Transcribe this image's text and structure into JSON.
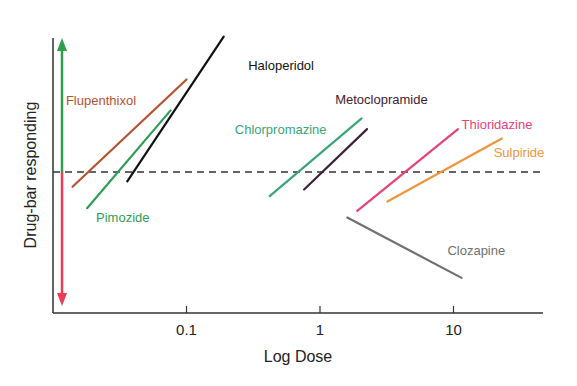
{
  "chart_data": {
    "type": "line",
    "title": "",
    "xlabel": "Log Dose",
    "ylabel": "Drug-bar responding",
    "xscale": "log",
    "xlim": [
      0.0105,
      44
    ],
    "ylim": [
      -1.05,
      1.0
    ],
    "x_ticks": [
      {
        "value": 0.1,
        "label": "0.1"
      },
      {
        "value": 1,
        "label": "1"
      },
      {
        "value": 10,
        "label": "10"
      }
    ],
    "baseline": {
      "value": 0,
      "style": "dashed",
      "color": "#333333"
    },
    "direction_arrow": {
      "up_color": "#2e9e4f",
      "down_color": "#ee3b55",
      "at_dose": 0.012
    },
    "grid": false,
    "legend": "inline-labels",
    "series": [
      {
        "name": "Flupenthixol",
        "color": "#b5522f",
        "x": [
          0.014,
          0.1
        ],
        "y": [
          -0.11,
          0.69
        ],
        "label_at": {
          "x": 0.0125,
          "y": 0.5
        }
      },
      {
        "name": "Pimozide",
        "color": "#2f9e57",
        "x": [
          0.018,
          0.076
        ],
        "y": [
          -0.27,
          0.46
        ],
        "label_at": {
          "x": 0.021,
          "y": -0.37
        }
      },
      {
        "name": "Haloperidol",
        "color": "#111111",
        "x": [
          0.036,
          0.19
        ],
        "y": [
          -0.07,
          1.01
        ],
        "label_at": {
          "x": 0.29,
          "y": 0.76
        }
      },
      {
        "name": "Chlorpromazine",
        "color": "#3aa57a",
        "x": [
          0.42,
          2.05
        ],
        "y": [
          -0.18,
          0.4
        ],
        "label_at": {
          "x": 0.23,
          "y": 0.28
        }
      },
      {
        "name": "Metoclopramide",
        "color": "#3d2136",
        "x": [
          0.76,
          2.25
        ],
        "y": [
          -0.13,
          0.32
        ],
        "label_at": {
          "x": 1.3,
          "y": 0.51
        }
      },
      {
        "name": "Thioridazine",
        "color": "#e8427a",
        "x": [
          1.9,
          10.8
        ],
        "y": [
          -0.29,
          0.32
        ],
        "label_at": {
          "x": 11.5,
          "y": 0.32
        }
      },
      {
        "name": "Sulpiride",
        "color": "#f0953a",
        "x": [
          3.2,
          23
        ],
        "y": [
          -0.22,
          0.25
        ],
        "label_at": {
          "x": 20,
          "y": 0.11
        }
      },
      {
        "name": "Clozapine",
        "color": "#707070",
        "x": [
          1.6,
          11.5
        ],
        "y": [
          -0.34,
          -0.79
        ],
        "label_at": {
          "x": 9.0,
          "y": -0.62
        }
      }
    ]
  }
}
